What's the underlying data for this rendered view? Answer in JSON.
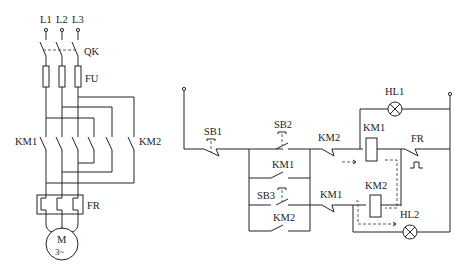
{
  "main_circuit": {
    "phases": [
      "L1",
      "L2",
      "L3"
    ],
    "switch_label": "QK",
    "fuse_label": "FU",
    "contactor_left_label": "KM1",
    "contactor_right_label": "KM2",
    "overload_label": "FR",
    "motor_label": "M",
    "motor_sub_label": "3~"
  },
  "control_circuit": {
    "stop_button": "SB1",
    "forward_button": "SB2",
    "reverse_button": "SB3",
    "hold_km1": "KM1",
    "hold_km2": "KM2",
    "interlock_km2": "KM2",
    "interlock_km1": "KM1",
    "coil_km1": "KM1",
    "coil_km2": "KM2",
    "overload_contact": "FR",
    "lamp_1": "HL1",
    "lamp_2": "HL2"
  }
}
